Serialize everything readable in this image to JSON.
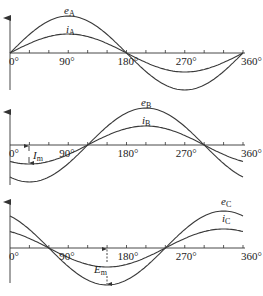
{
  "figure": {
    "x_ticks": [
      "0°",
      "90°",
      "180°",
      "270°",
      "360°"
    ],
    "panels": [
      {
        "id": "A",
        "emf_label": "e",
        "emf_sub": "A",
        "cur_label": "i",
        "cur_sub": "A",
        "phase_deg": 0
      },
      {
        "id": "B",
        "emf_label": "e",
        "emf_sub": "B",
        "cur_label": "i",
        "cur_sub": "B",
        "phase_deg": -120,
        "annotation": {
          "label": "I",
          "sub": "m"
        }
      },
      {
        "id": "C",
        "emf_label": "e",
        "emf_sub": "C",
        "cur_label": "i",
        "cur_sub": "C",
        "phase_deg": 120,
        "annotation": {
          "label": "E",
          "sub": "m"
        }
      }
    ]
  },
  "colors": {
    "curve": "#3a3a3a",
    "axis": "#333333",
    "background": "#ffffff"
  }
}
